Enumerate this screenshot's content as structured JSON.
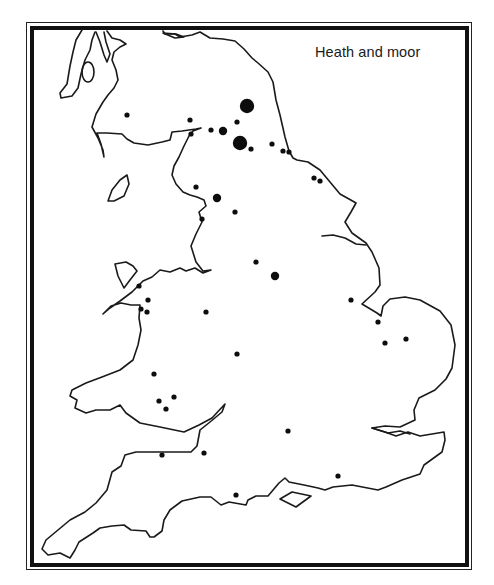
{
  "map": {
    "title": "Heath and moor",
    "region": "England and Wales",
    "ink_color": "#111111",
    "background": "#ffffff",
    "sites": [
      {
        "x": 247,
        "y": 106,
        "size": "large"
      },
      {
        "x": 240,
        "y": 143,
        "size": "large"
      },
      {
        "x": 223,
        "y": 131,
        "size": "medium"
      },
      {
        "x": 217,
        "y": 198,
        "size": "medium"
      },
      {
        "x": 275,
        "y": 276,
        "size": "medium"
      },
      {
        "x": 127,
        "y": 115,
        "size": "small"
      },
      {
        "x": 190,
        "y": 120,
        "size": "small"
      },
      {
        "x": 237,
        "y": 122,
        "size": "small"
      },
      {
        "x": 211,
        "y": 130,
        "size": "small"
      },
      {
        "x": 191,
        "y": 134,
        "size": "small"
      },
      {
        "x": 251,
        "y": 149,
        "size": "small"
      },
      {
        "x": 272,
        "y": 144,
        "size": "small"
      },
      {
        "x": 283,
        "y": 151,
        "size": "small"
      },
      {
        "x": 289,
        "y": 152,
        "size": "small"
      },
      {
        "x": 314,
        "y": 178,
        "size": "small"
      },
      {
        "x": 320,
        "y": 181,
        "size": "small"
      },
      {
        "x": 196,
        "y": 187,
        "size": "small"
      },
      {
        "x": 235,
        "y": 212,
        "size": "small"
      },
      {
        "x": 202,
        "y": 219,
        "size": "small"
      },
      {
        "x": 256,
        "y": 262,
        "size": "small"
      },
      {
        "x": 139,
        "y": 286,
        "size": "small"
      },
      {
        "x": 148,
        "y": 300,
        "size": "small"
      },
      {
        "x": 141,
        "y": 309,
        "size": "small"
      },
      {
        "x": 147,
        "y": 312,
        "size": "small"
      },
      {
        "x": 206,
        "y": 312,
        "size": "small"
      },
      {
        "x": 351,
        "y": 300,
        "size": "small"
      },
      {
        "x": 378,
        "y": 322,
        "size": "small"
      },
      {
        "x": 385,
        "y": 343,
        "size": "small"
      },
      {
        "x": 406,
        "y": 339,
        "size": "small"
      },
      {
        "x": 237,
        "y": 354,
        "size": "small"
      },
      {
        "x": 154,
        "y": 374,
        "size": "small"
      },
      {
        "x": 174,
        "y": 397,
        "size": "small"
      },
      {
        "x": 159,
        "y": 401,
        "size": "small"
      },
      {
        "x": 166,
        "y": 409,
        "size": "small"
      },
      {
        "x": 288,
        "y": 431,
        "size": "small"
      },
      {
        "x": 162,
        "y": 455,
        "size": "small"
      },
      {
        "x": 204,
        "y": 453,
        "size": "small"
      },
      {
        "x": 338,
        "y": 476,
        "size": "small"
      },
      {
        "x": 236,
        "y": 495,
        "size": "small"
      }
    ],
    "dot_radius": {
      "small": 2.6,
      "medium": 4.2,
      "large": 7.2
    }
  }
}
